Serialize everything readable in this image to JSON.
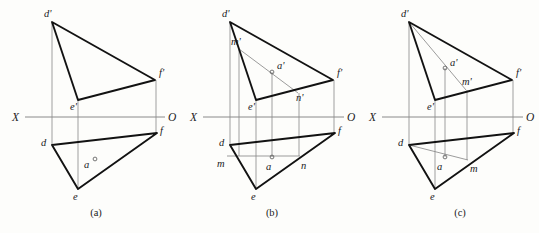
{
  "figure": {
    "background_color": "#fdfdfb",
    "edge_color": "#121212",
    "aux_color": "#8a8a8a",
    "axis_color": "#8a8a8a"
  },
  "panels": [
    {
      "id": "a",
      "caption": "(a)",
      "caption_x": 96,
      "caption_y": 216,
      "axis": {
        "left_label": "X",
        "right_label": "O",
        "left_label_x": 12,
        "right_label_x": 168,
        "label_y": 121,
        "y": 117,
        "x_start": 25,
        "x_end": 165
      },
      "vertices": [
        {
          "name": "d'",
          "x": 52,
          "y": 22,
          "label_x": 44,
          "label_y": 17
        },
        {
          "name": "f'",
          "x": 155,
          "y": 80,
          "label_x": 159,
          "label_y": 76
        },
        {
          "name": "e'",
          "x": 78,
          "y": 100,
          "label_x": 70,
          "label_y": 110
        },
        {
          "name": "d",
          "x": 52,
          "y": 145,
          "label_x": 41,
          "label_y": 146
        },
        {
          "name": "f",
          "x": 157,
          "y": 133,
          "label_x": 160,
          "label_y": 134
        },
        {
          "name": "e",
          "x": 78,
          "y": 189,
          "label_x": 73,
          "label_y": 200
        }
      ],
      "point_a": {
        "front": null,
        "top": {
          "name": "a",
          "x": 95,
          "y": 159,
          "label_x": 84,
          "label_y": 168
        }
      },
      "projectors": [
        {
          "x": 52,
          "y1": 22,
          "y2": 145
        },
        {
          "x": 78,
          "y1": 100,
          "y2": 189
        },
        {
          "x": 156,
          "y1": 80,
          "y2": 133
        }
      ],
      "aux_lines": []
    },
    {
      "id": "b",
      "caption": "(b)",
      "caption_x": 272,
      "caption_y": 216,
      "axis": {
        "left_label": "X",
        "right_label": "O",
        "left_label_x": 190,
        "right_label_x": 347,
        "label_y": 121,
        "y": 117,
        "x_start": 203,
        "x_end": 344
      },
      "vertices": [
        {
          "name": "d'",
          "x": 230,
          "y": 22,
          "label_x": 222,
          "label_y": 17
        },
        {
          "name": "f'",
          "x": 333,
          "y": 80,
          "label_x": 337,
          "label_y": 76
        },
        {
          "name": "e'",
          "x": 256,
          "y": 100,
          "label_x": 248,
          "label_y": 110
        },
        {
          "name": "d",
          "x": 230,
          "y": 145,
          "label_x": 219,
          "label_y": 146
        },
        {
          "name": "f",
          "x": 335,
          "y": 133,
          "label_x": 338,
          "label_y": 134
        },
        {
          "name": "e",
          "x": 256,
          "y": 189,
          "label_x": 251,
          "label_y": 200
        }
      ],
      "point_a": {
        "front": {
          "name": "a'",
          "x": 272,
          "y": 72,
          "label_x": 277,
          "label_y": 69
        },
        "top": {
          "name": "a",
          "x": 272,
          "y": 157,
          "label_x": 266,
          "label_y": 170
        }
      },
      "aux_points": [
        {
          "name": "m'",
          "x": 239,
          "y": 49,
          "label_x": 231,
          "label_y": 45
        },
        {
          "name": "n'",
          "x": 298,
          "y": 93,
          "label_x": 296,
          "label_y": 101
        },
        {
          "name": "m",
          "x": 227,
          "y": 156,
          "label_x": 217,
          "label_y": 167
        },
        {
          "name": "n",
          "x": 300,
          "y": 156,
          "label_x": 301,
          "label_y": 169
        }
      ],
      "projectors": [
        {
          "x": 230,
          "y1": 22,
          "y2": 145
        },
        {
          "x": 256,
          "y1": 100,
          "y2": 189
        },
        {
          "x": 334,
          "y1": 80,
          "y2": 133
        },
        {
          "x": 272,
          "y1": 72,
          "y2": 157
        },
        {
          "x": 239,
          "y1": 49,
          "y2": 156
        },
        {
          "x": 299,
          "y1": 93,
          "y2": 156
        }
      ],
      "aux_lines": [
        {
          "name": "mn-front",
          "x1": 239,
          "y1": 49,
          "x2": 298,
          "y2": 93
        },
        {
          "name": "mn-top",
          "x1": 227,
          "y1": 156,
          "x2": 300,
          "y2": 156
        }
      ]
    },
    {
      "id": "c",
      "caption": "(c)",
      "caption_x": 460,
      "caption_y": 216,
      "axis": {
        "left_label": "X",
        "right_label": "O",
        "left_label_x": 369,
        "right_label_x": 526,
        "label_y": 121,
        "y": 117,
        "x_start": 382,
        "x_end": 523
      },
      "vertices": [
        {
          "name": "d'",
          "x": 409,
          "y": 22,
          "label_x": 401,
          "label_y": 17
        },
        {
          "name": "f'",
          "x": 512,
          "y": 80,
          "label_x": 516,
          "label_y": 76
        },
        {
          "name": "e'",
          "x": 435,
          "y": 100,
          "label_x": 427,
          "label_y": 110
        },
        {
          "name": "d",
          "x": 409,
          "y": 145,
          "label_x": 398,
          "label_y": 146
        },
        {
          "name": "f",
          "x": 514,
          "y": 133,
          "label_x": 517,
          "label_y": 134
        },
        {
          "name": "e",
          "x": 435,
          "y": 189,
          "label_x": 430,
          "label_y": 200
        }
      ],
      "point_a": {
        "front": {
          "name": "a'",
          "x": 445,
          "y": 68,
          "label_x": 450,
          "label_y": 66
        },
        "top": {
          "name": "a",
          "x": 445,
          "y": 157,
          "label_x": 437,
          "label_y": 170
        }
      },
      "aux_points": [
        {
          "name": "m'",
          "x": 466,
          "y": 90,
          "label_x": 462,
          "label_y": 85
        },
        {
          "name": "m",
          "x": 468,
          "y": 160,
          "label_x": 470,
          "label_y": 172
        }
      ],
      "projectors": [
        {
          "x": 409,
          "y1": 22,
          "y2": 145
        },
        {
          "x": 435,
          "y1": 100,
          "y2": 189
        },
        {
          "x": 513,
          "y1": 80,
          "y2": 133
        },
        {
          "x": 445,
          "y1": 68,
          "y2": 157
        },
        {
          "x": 467,
          "y1": 90,
          "y2": 160
        }
      ],
      "aux_lines": [
        {
          "name": "dm-front",
          "x1": 409,
          "y1": 22,
          "x2": 466,
          "y2": 90
        },
        {
          "name": "dm-top",
          "x1": 409,
          "y1": 145,
          "x2": 468,
          "y2": 160
        }
      ]
    }
  ]
}
